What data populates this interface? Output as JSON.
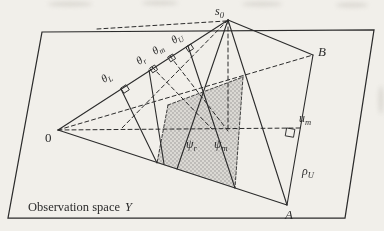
{
  "colors": {
    "paper": "#f1efea",
    "ink": "#2b2b2b",
    "stipple": "#8a8a88",
    "stipple_bg": "#dbd9d4",
    "smudge": "#c7c4bd"
  },
  "figure_labels": {
    "s0": {
      "main": "s",
      "sub": "0"
    },
    "origin": {
      "main": "0"
    },
    "B": {
      "main": "B"
    },
    "A": {
      "main": "A"
    },
    "u_m": {
      "main": "u",
      "sub": "m"
    },
    "rho_U": {
      "main": "ρ",
      "sub": "U"
    },
    "theta_L": {
      "main": "θ",
      "sub": "L"
    },
    "theta_r": {
      "main": "θ",
      "sub": "r"
    },
    "theta_m": {
      "main": "θ",
      "sub": "m"
    },
    "theta_U": {
      "main": "θ",
      "sub": "U"
    },
    "psi_r": {
      "main": "ψ",
      "sub": "r"
    },
    "psi_m": {
      "main": "ψ",
      "sub": "m"
    },
    "caption": {
      "text": "Observation space",
      "symbol": "Y"
    }
  }
}
